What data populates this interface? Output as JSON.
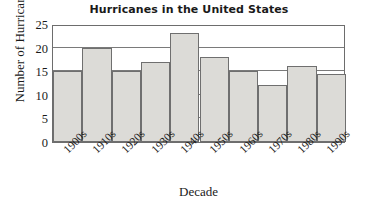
{
  "chart_data": {
    "type": "bar",
    "title": "Hurricanes in the United States",
    "xlabel": "Decade",
    "ylabel": "Number of Hurricanes",
    "categories": [
      "1900s",
      "1910s",
      "1920s",
      "1930s",
      "1940s",
      "1950s",
      "1960s",
      "1970s",
      "1980s",
      "1990s"
    ],
    "values": [
      15,
      20,
      15,
      17,
      23,
      18,
      15,
      12,
      16,
      14.5
    ],
    "ylim": [
      0,
      25
    ],
    "yticks": [
      0,
      5,
      10,
      15,
      20,
      25
    ],
    "grid": true,
    "legend": null,
    "bar_color": "#dcdbd7",
    "bar_border_color": "#6f6f6f",
    "axis_color": "#6d6d6d",
    "text_color": "#1a1a1a"
  }
}
